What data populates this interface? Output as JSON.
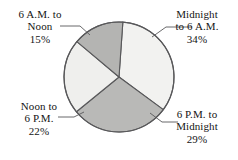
{
  "chart_data": {
    "type": "pie",
    "title": "",
    "subtitle": "",
    "xlabel": "",
    "ylabel": "",
    "legend_position": "none",
    "grid": false,
    "labels_outside": true,
    "categories": [
      "Midnight to 6 A.M.",
      "6 P.M. to Midnight",
      "Noon to 6 P.M.",
      "6 A.M. to Noon"
    ],
    "values": [
      34,
      29,
      22,
      15
    ],
    "value_suffix": "%",
    "slices": [
      {
        "name": "midnight-to-6am",
        "label_lines": [
          "Midnight",
          "to 6 A.M."
        ],
        "percent_text": "34%",
        "value": 34,
        "color": "#f2f2f0",
        "start_angle_deg": 4,
        "end_angle_deg": 126.4
      },
      {
        "name": "6pm-to-midnight",
        "label_lines": [
          "6 P.M. to",
          "Midnight"
        ],
        "percent_text": "29%",
        "value": 29,
        "color": "#b9b9b7",
        "start_angle_deg": 126.4,
        "end_angle_deg": 230.8
      },
      {
        "name": "noon-to-6pm",
        "label_lines": [
          "Noon to",
          "6 P.M."
        ],
        "percent_text": "22%",
        "value": 22,
        "color": "#efefed",
        "start_angle_deg": 230.8,
        "end_angle_deg": 310
      },
      {
        "name": "6am-to-noon",
        "label_lines": [
          "6 A.M. to",
          "Noon"
        ],
        "percent_text": "15%",
        "value": 15,
        "color": "#b4b4b2",
        "start_angle_deg": 310,
        "end_angle_deg": 364
      }
    ],
    "colors": [
      "#f2f2f0",
      "#b9b9b7",
      "#efefed",
      "#b4b4b2"
    ],
    "outline_color": "#58585a",
    "background": "#ffffff"
  },
  "labels": {
    "midnight_6am": {
      "line1": "Midnight",
      "line2": "to 6 A.M.",
      "percent": "34%"
    },
    "sixam_noon": {
      "line1": "6 A.M. to",
      "line2": "Noon",
      "percent": "15%"
    },
    "noon_sixpm": {
      "line1": "Noon to",
      "line2": "6 P.M.",
      "percent": "22%"
    },
    "sixpm_midnight": {
      "line1": "6 P.M. to",
      "line2": "Midnight",
      "percent": "29%"
    }
  }
}
